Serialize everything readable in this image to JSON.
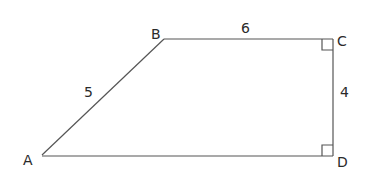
{
  "diagram": {
    "vertices": [
      {
        "name": "A",
        "label": "A",
        "x": 42,
        "y": 155
      },
      {
        "name": "B",
        "label": "B",
        "x": 164,
        "y": 39
      },
      {
        "name": "C",
        "label": "C",
        "x": 333,
        "y": 39
      },
      {
        "name": "D",
        "label": "D",
        "x": 333,
        "y": 156
      }
    ],
    "sides": [
      {
        "from": "A",
        "to": "B",
        "length_label": "5"
      },
      {
        "from": "B",
        "to": "C",
        "length_label": "6"
      },
      {
        "from": "C",
        "to": "D",
        "length_label": "4"
      },
      {
        "from": "A",
        "to": "D",
        "length_label": ""
      }
    ],
    "right_angles": [
      "C",
      "D"
    ],
    "stroke_color": "#555555",
    "text_color": "#2a2a2a"
  }
}
